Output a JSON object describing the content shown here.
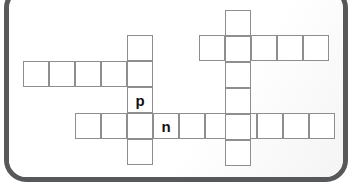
{
  "puzzle": {
    "title": "Crossword grid",
    "cell_size": 26,
    "colors": {
      "cell_border": "#8d8e90",
      "cell_fill": "#ffffff",
      "frame_border": "#57585a",
      "letter_color": "#111111",
      "page_background": "#ffffff"
    },
    "entries": [
      {
        "name": "left-across-word",
        "direction": "across",
        "x": 23,
        "y": 61,
        "length": 5,
        "letters": [
          "",
          "",
          "",
          "",
          ""
        ]
      },
      {
        "name": "upper-right-across-word",
        "direction": "across",
        "x": 199,
        "y": 35,
        "length": 5,
        "letters": [
          "",
          "",
          "",
          "",
          ""
        ]
      },
      {
        "name": "bottom-across-word",
        "direction": "across",
        "x": 75,
        "y": 113,
        "length": 10,
        "letters": [
          "",
          "",
          "",
          "n",
          "",
          "",
          "",
          "",
          "",
          ""
        ]
      },
      {
        "name": "p-down-word",
        "direction": "down",
        "x": 127,
        "y": 35,
        "length": 5,
        "letters": [
          "",
          "",
          "p",
          "",
          ""
        ]
      },
      {
        "name": "right-down-word",
        "direction": "down",
        "x": 225,
        "y": 10,
        "length": 6,
        "letters": [
          "",
          "",
          "",
          "",
          "",
          ""
        ]
      }
    ],
    "filled_letters": [
      {
        "name": "letter-p",
        "value": "p",
        "x": 127,
        "y": 87
      },
      {
        "name": "letter-n",
        "value": "n",
        "x": 153,
        "y": 113
      }
    ]
  }
}
